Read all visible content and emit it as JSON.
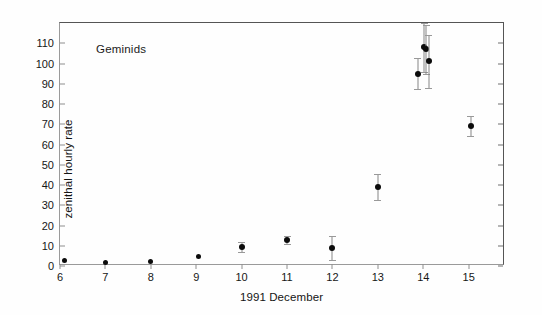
{
  "figure": {
    "annotation": "Geminids",
    "background_color": "#ffffff",
    "marker_color": "#0b0b0b",
    "errorbar_color": "#858585",
    "axis_color": "#8d8d8d",
    "frame_color": "#555555"
  },
  "chart_data": {
    "type": "scatter",
    "title": "",
    "annotation": "Geminids",
    "xlabel": "1991 December",
    "ylabel": "zenithal hourly rate",
    "xlim": [
      6,
      15.8
    ],
    "ylim": [
      0,
      120
    ],
    "xticks": [
      6,
      7,
      8,
      9,
      10,
      11,
      12,
      13,
      14,
      15
    ],
    "xtick_labels": [
      "6",
      "7",
      "8",
      "9",
      "10",
      "11",
      "12",
      "13",
      "14",
      "15"
    ],
    "yticks": [
      0,
      10,
      20,
      30,
      40,
      50,
      60,
      70,
      80,
      90,
      100,
      110
    ],
    "ytick_labels": [
      "0",
      "10",
      "20",
      "30",
      "40",
      "50",
      "60",
      "70",
      "80",
      "90",
      "100",
      "110"
    ],
    "grid": false,
    "legend": false,
    "errorbars": true,
    "points": [
      {
        "x": 6.1,
        "y": 2.5,
        "yerr": 0,
        "label": "Dec 6"
      },
      {
        "x": 7.0,
        "y": 1.5,
        "yerr": 0,
        "label": "Dec 7"
      },
      {
        "x": 8.0,
        "y": 2.0,
        "yerr": 0,
        "label": "Dec 8"
      },
      {
        "x": 9.05,
        "y": 4.5,
        "yerr": 0,
        "label": "Dec 9"
      },
      {
        "x": 10.0,
        "y": 9.5,
        "yerr": 2.5,
        "label": "Dec 10"
      },
      {
        "x": 11.0,
        "y": 13.0,
        "yerr": 2.0,
        "label": "Dec 11"
      },
      {
        "x": 12.0,
        "y": 9.0,
        "yerr": 6.0,
        "label": "Dec 12"
      },
      {
        "x": 13.0,
        "y": 39.0,
        "yerr": 6.5,
        "label": "Dec 13"
      },
      {
        "x": 13.88,
        "y": 95.0,
        "yerr": 7.5,
        "label": "Dec 14 a"
      },
      {
        "x": 14.02,
        "y": 108.0,
        "yerr": 12.0,
        "label": "Dec 14 b"
      },
      {
        "x": 14.07,
        "y": 107.0,
        "yerr": 12.0,
        "label": "Dec 14 c"
      },
      {
        "x": 14.12,
        "y": 101.0,
        "yerr": 13.0,
        "label": "Dec 14 d"
      },
      {
        "x": 15.05,
        "y": 69.0,
        "yerr": 5.0,
        "label": "Dec 15"
      }
    ]
  }
}
